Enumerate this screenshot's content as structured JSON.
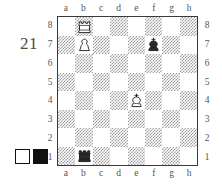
{
  "diagram": {
    "number": "21",
    "files": [
      "a",
      "b",
      "c",
      "d",
      "e",
      "f",
      "g",
      "h"
    ],
    "ranks": [
      "8",
      "7",
      "6",
      "5",
      "4",
      "3",
      "2",
      "1"
    ],
    "light_square_color": "#ffffff",
    "dark_square_color": "#9d9d9d",
    "border_color": "#3a3a3a",
    "label_color": "#555555"
  },
  "legend": {
    "white_label": "white-square",
    "black_label": "black-square",
    "white_color": "#ffffff",
    "black_color": "#111111"
  },
  "chart_data": {
    "type": "table",
    "categories": [
      "a",
      "b",
      "c",
      "d",
      "e",
      "f",
      "g",
      "h"
    ],
    "x": [
      "8",
      "7",
      "6",
      "5",
      "4",
      "3",
      "2",
      "1"
    ],
    "pieces": [
      {
        "square": "b8",
        "piece": "rook",
        "color": "white",
        "glyph": "♖"
      },
      {
        "square": "b7",
        "piece": "pawn",
        "color": "white",
        "glyph": "♙"
      },
      {
        "square": "f7",
        "piece": "king",
        "color": "black",
        "glyph": "♚"
      },
      {
        "square": "e4",
        "piece": "king",
        "color": "white",
        "glyph": "♔"
      },
      {
        "square": "b1",
        "piece": "rook",
        "color": "black",
        "glyph": "♜"
      }
    ],
    "fen": "1R6/1P3k2/8/8/4K3/8/8/1r6",
    "white_pieces": [
      "Rb8",
      "Pb7",
      "Ke4"
    ],
    "black_pieces": [
      "Kf7",
      "Rb1"
    ],
    "xlabel": "files",
    "ylabel": "ranks",
    "grid": true,
    "legend_position": "bottom-left"
  }
}
